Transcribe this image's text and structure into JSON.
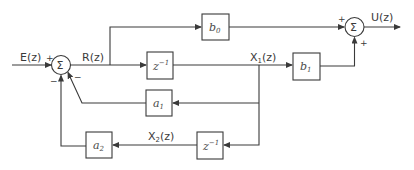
{
  "diagram": {
    "type": "block-diagram",
    "signals": {
      "input": "E(z)",
      "r": "R(z)",
      "x1": "X",
      "x1_sub": "1",
      "x1_arg": "(z)",
      "x2": "X",
      "x2_sub": "2",
      "x2_arg": "(z)",
      "output": "U(z)"
    },
    "blocks": {
      "b0": {
        "base": "b",
        "sub": "0"
      },
      "b1": {
        "base": "b",
        "sub": "1"
      },
      "a1": {
        "base": "a",
        "sub": "1"
      },
      "a2": {
        "base": "a",
        "sub": "2"
      },
      "delay1": {
        "base": "z",
        "sup": "−1"
      },
      "delay2": {
        "base": "z",
        "sup": "−1"
      }
    },
    "summers": {
      "sum1": {
        "symbol": "Σ",
        "signs": {
          "input": "+",
          "bottom": "−",
          "right_bottom": "−"
        }
      },
      "sum2": {
        "symbol": "Σ",
        "signs": {
          "left": "+",
          "bottom": "+"
        }
      }
    },
    "colors": {
      "stroke": "#3a3a3a",
      "background": "#ffffff"
    }
  }
}
